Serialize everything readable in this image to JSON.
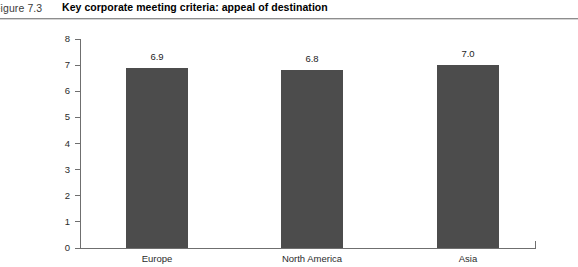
{
  "header": {
    "figure_number": "Figure 7.3",
    "title": "Key corporate meeting criteria: appeal of destination"
  },
  "chart_data": {
    "type": "bar",
    "title": "Key corporate meeting criteria: appeal of destination",
    "categories": [
      "Europe",
      "North America",
      "Asia"
    ],
    "values": [
      6.9,
      6.8,
      7.0
    ],
    "value_labels": [
      "6.9",
      "6.8",
      "7.0"
    ],
    "xlabel": "",
    "ylabel": "",
    "ylim": [
      0,
      8
    ],
    "y_ticks": [
      8,
      7,
      6,
      5,
      4,
      3,
      2,
      1,
      0
    ],
    "y_tick_labels": [
      "8",
      "7",
      "6",
      "5",
      "4",
      "3",
      "2",
      "1",
      "0"
    ],
    "grid": false,
    "legend": false,
    "bar_color": "#4c4c4c",
    "axis_color": "#6f6f6f"
  }
}
